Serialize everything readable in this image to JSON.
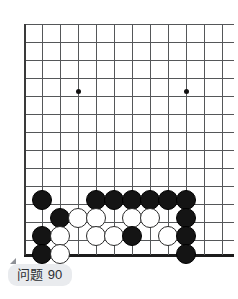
{
  "caption": {
    "label": "问题",
    "number": "90",
    "full": "问题 90"
  },
  "board": {
    "title": "Go board problem diagram",
    "grid": {
      "origin_x": 24,
      "origin_y": 24,
      "spacing": 18,
      "cols": 12,
      "rows": 13,
      "bottom_edge_y": 255,
      "line_color": "#555759",
      "edge_color": "#1b1b1b",
      "background": "#ffffff"
    },
    "hoshi": [
      {
        "x": 78,
        "y": 91
      },
      {
        "x": 186,
        "y": 91
      },
      {
        "x": 186,
        "y": 200
      }
    ],
    "stone_colors": {
      "black": "#141414",
      "white": "#ffffff",
      "white_outline": "#2b2b2b"
    },
    "stones": [
      {
        "color": "black",
        "x": 42,
        "y": 200
      },
      {
        "color": "black",
        "x": 96,
        "y": 200
      },
      {
        "color": "black",
        "x": 114,
        "y": 200
      },
      {
        "color": "black",
        "x": 132,
        "y": 200
      },
      {
        "color": "black",
        "x": 150,
        "y": 200
      },
      {
        "color": "black",
        "x": 168,
        "y": 200
      },
      {
        "color": "black",
        "x": 186,
        "y": 200
      },
      {
        "color": "black",
        "x": 60,
        "y": 218
      },
      {
        "color": "white",
        "x": 78,
        "y": 218
      },
      {
        "color": "white",
        "x": 96,
        "y": 218
      },
      {
        "color": "white",
        "x": 132,
        "y": 218
      },
      {
        "color": "white",
        "x": 150,
        "y": 218
      },
      {
        "color": "black",
        "x": 186,
        "y": 218
      },
      {
        "color": "black",
        "x": 42,
        "y": 236
      },
      {
        "color": "white",
        "x": 60,
        "y": 236
      },
      {
        "color": "white",
        "x": 96,
        "y": 236
      },
      {
        "color": "white",
        "x": 114,
        "y": 236
      },
      {
        "color": "black",
        "x": 132,
        "y": 236
      },
      {
        "color": "white",
        "x": 168,
        "y": 236
      },
      {
        "color": "black",
        "x": 186,
        "y": 236
      },
      {
        "color": "black",
        "x": 42,
        "y": 254
      },
      {
        "color": "white",
        "x": 60,
        "y": 254
      },
      {
        "color": "black",
        "x": 186,
        "y": 254
      }
    ]
  }
}
